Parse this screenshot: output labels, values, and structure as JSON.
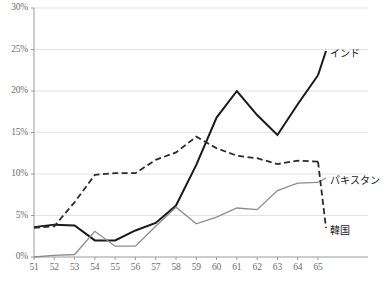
{
  "chart_data": {
    "type": "line",
    "title": "",
    "xlabel": "",
    "ylabel": "",
    "x": [
      51,
      52,
      53,
      54,
      55,
      56,
      57,
      58,
      59,
      60,
      61,
      62,
      63,
      64,
      65
    ],
    "xtick_labels": [
      "51",
      "52",
      "53",
      "54",
      "55",
      "56",
      "57",
      "58",
      "59",
      "60",
      "61",
      "62",
      "63",
      "64",
      "65"
    ],
    "ytick_labels": [
      "0%",
      "5%",
      "10%",
      "15%",
      "20%",
      "25%",
      "30%"
    ],
    "ytick_values": [
      0,
      5,
      10,
      15,
      20,
      25,
      30
    ],
    "ylim": [
      0,
      30
    ],
    "xlim": [
      51,
      65
    ],
    "grid": "horizontal",
    "legend_position": "right-inline",
    "series": [
      {
        "name": "インド",
        "color": "#1a1a1a",
        "style": "solid",
        "width": 2.0,
        "label_x": 330,
        "label_y": 45,
        "values": [
          3.6,
          3.9,
          3.8,
          2.0,
          2.0,
          3.2,
          4.0,
          6.0,
          11.0,
          16.8,
          20.0,
          17.1,
          14.7,
          18.3,
          21.8
        ]
      },
      {
        "name": "パキスタン",
        "color": "#8c8c8c",
        "style": "solid",
        "width": 1.3,
        "label_x": 330,
        "label_y": 172,
        "values": [
          0.0,
          0.1,
          0.2,
          3.0,
          1.3,
          1.3,
          3.6,
          6.0,
          4.0,
          4.7,
          5.9,
          5.7,
          8.0,
          8.8,
          9.0
        ]
      },
      {
        "name": "韓国",
        "color": "#2b2b2b",
        "style": "dashed",
        "width": 1.8,
        "label_x": 330,
        "label_y": 222,
        "values": [
          3.5,
          3.6,
          6.6,
          9.9,
          10.1,
          10.1,
          11.7,
          12.6,
          14.5,
          13.1,
          12.1,
          11.9,
          11.2,
          11.6,
          11.5
        ]
      }
    ],
    "series_actual": {
      "note": "values rendered from per-series point arrays below",
      "india": [
        3.6,
        3.9,
        3.8,
        2.0,
        2.0,
        3.2,
        4.0,
        6.0,
        11.0,
        16.8,
        20.0,
        17.1,
        14.7,
        18.3,
        21.8
      ],
      "pakistan": [
        0.0,
        0.1,
        0.2,
        3.0,
        1.3,
        1.3,
        3.6,
        6.0,
        4.0,
        4.7,
        5.9,
        5.7,
        8.0,
        8.8,
        9.0
      ],
      "korea": [
        3.5,
        3.6,
        6.6,
        9.9,
        10.1,
        10.1,
        11.7,
        12.6,
        14.5,
        13.1,
        12.1,
        11.9,
        11.2,
        11.6,
        11.5
      ]
    },
    "points": {
      "india": [
        3.6,
        3.9,
        3.8,
        2.0,
        2.0,
        3.2,
        4.1,
        6.2,
        11.1,
        16.8,
        20.0,
        17.1,
        14.7,
        18.4,
        21.9
      ],
      "pakistan": [
        0.0,
        0.2,
        0.3,
        3.1,
        1.3,
        1.3,
        3.7,
        6.0,
        4.0,
        4.8,
        5.9,
        5.7,
        8.0,
        8.9,
        9.0
      ],
      "korea": [
        3.5,
        3.7,
        6.6,
        9.9,
        10.1,
        10.1,
        11.7,
        12.6,
        14.5,
        13.1,
        12.2,
        11.9,
        11.2,
        11.6,
        11.5
      ]
    }
  },
  "axis": {
    "y_labels": [
      "30%",
      "25%",
      "20%",
      "15%",
      "10%",
      "5%",
      "0%"
    ],
    "x_labels": [
      "51",
      "52",
      "53",
      "54",
      "55",
      "56",
      "57",
      "58",
      "59",
      "60",
      "61",
      "62",
      "63",
      "64",
      "65"
    ]
  },
  "labels": {
    "india": "インド",
    "pakistan": "パキスタン",
    "korea": "韓国"
  },
  "colors": {
    "india": "#1a1a1a",
    "pakistan": "#8c8c8c",
    "korea": "#2b2b2b",
    "grid": "#e2e2e2",
    "axis": "#9a9a9a",
    "tick_text": "#6d6d6d",
    "background": "#ffffff"
  }
}
